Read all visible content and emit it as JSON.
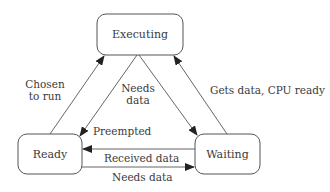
{
  "diagram": {
    "type": "state-transition",
    "states": [
      {
        "id": "executing",
        "label": "Executing"
      },
      {
        "id": "ready",
        "label": "Ready"
      },
      {
        "id": "waiting",
        "label": "Waiting"
      }
    ],
    "transitions": [
      {
        "from": "ready",
        "to": "executing",
        "label_line1": "Chosen",
        "label_line2": "to run"
      },
      {
        "from": "executing",
        "to": "ready",
        "label": "Preempted"
      },
      {
        "from": "executing",
        "to": "waiting",
        "label_line1": "Needs",
        "label_line2": "data"
      },
      {
        "from": "waiting",
        "to": "executing",
        "label": "Gets data, CPU ready"
      },
      {
        "from": "waiting",
        "to": "ready",
        "label": "Received data"
      },
      {
        "from": "ready",
        "to": "waiting",
        "label": "Needs data"
      }
    ],
    "colors": {
      "stroke": "#555555",
      "text": "#3a3a3a",
      "background": "#ffffff"
    }
  }
}
